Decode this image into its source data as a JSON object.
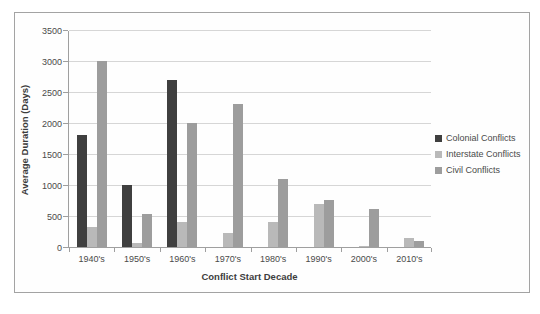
{
  "chart": {
    "y_tick_labels": [
      "0",
      "500",
      "1000",
      "1500",
      "2000",
      "2500",
      "3000",
      "3500"
    ]
  },
  "chart_data": {
    "type": "bar",
    "title": "",
    "xlabel": "Conflict Start Decade",
    "ylabel": "Average Duration (Days)",
    "categories": [
      "1940's",
      "1950's",
      "1960's",
      "1970's",
      "1980's",
      "1990's",
      "2000's",
      "2010's"
    ],
    "series": [
      {
        "name": "Colonial Conflicts",
        "color": "#3f3f3f",
        "values": [
          1800,
          1000,
          2700,
          0,
          0,
          0,
          0,
          0
        ]
      },
      {
        "name": "Interstate Conflicts",
        "color": "#b9b9b9",
        "values": [
          320,
          60,
          400,
          230,
          400,
          700,
          20,
          150
        ]
      },
      {
        "name": "Civil Conflicts",
        "color": "#9d9d9d",
        "values": [
          3000,
          530,
          2000,
          2300,
          1100,
          760,
          620,
          100
        ]
      }
    ],
    "ylim": [
      0,
      3500
    ],
    "y_step": 500,
    "grid": true,
    "legend_position": "right",
    "colors": {
      "gridline": "#d6d6d6",
      "axis": "#9f9f9f",
      "frame_border": "#a3a3a3",
      "text": "#4a4a4a"
    }
  }
}
